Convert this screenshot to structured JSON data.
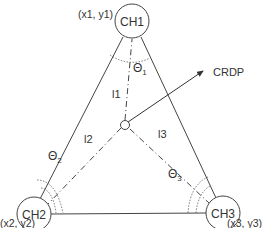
{
  "diagram": {
    "nodes": [
      {
        "id": "CH1",
        "label": "CH1",
        "coord_label": "(x1, y1)"
      },
      {
        "id": "CH2",
        "label": "CH2",
        "coord_label": "(x2, y2)"
      },
      {
        "id": "CH3",
        "label": "CH3",
        "coord_label": "(x3, y3)"
      }
    ],
    "center_point_label": "CRDP",
    "distances": [
      "l1",
      "l2",
      "l3"
    ],
    "angles": [
      {
        "symbol": "Θ",
        "sub": "1"
      },
      {
        "symbol": "Θ",
        "sub": "2"
      },
      {
        "symbol": "Θ",
        "sub": "3"
      }
    ],
    "colors": {
      "stroke": "#444444",
      "text": "#333333",
      "background": "#ffffff"
    }
  }
}
